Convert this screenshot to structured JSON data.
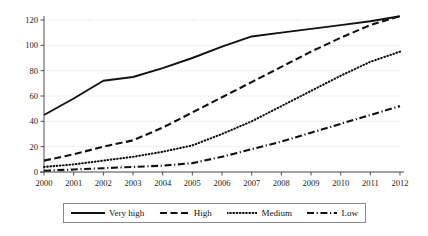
{
  "chart_data": {
    "type": "line",
    "title": "",
    "xlabel": "",
    "ylabel": "",
    "x": [
      2000,
      2001,
      2002,
      2003,
      2004,
      2005,
      2006,
      2007,
      2008,
      2009,
      2010,
      2011,
      2012
    ],
    "xticklabels": [
      "2000",
      "2001",
      "2002",
      "2003",
      "2004",
      "2005",
      "2006",
      "2007",
      "2008",
      "2009",
      "2010",
      "2011",
      "2012"
    ],
    "yticks": [
      0,
      20,
      40,
      60,
      80,
      100,
      120
    ],
    "yticklabels": [
      "0",
      "20",
      "40",
      "60",
      "80",
      "100",
      "120"
    ],
    "ylim": [
      0,
      128
    ],
    "xlim": [
      2000,
      2012
    ],
    "grid": "horizontal-dotted",
    "legend_position": "bottom-outside",
    "series": [
      {
        "name": "Very high",
        "style": "solid",
        "values": [
          45,
          58,
          72,
          75,
          82,
          90,
          99,
          107,
          110,
          113,
          116,
          119,
          123
        ]
      },
      {
        "name": "High",
        "style": "dashed",
        "values": [
          9,
          14,
          20,
          25,
          35,
          47,
          59,
          71,
          83,
          95,
          106,
          116,
          123
        ]
      },
      {
        "name": "Medium",
        "style": "dotted",
        "values": [
          4,
          6,
          9,
          12,
          16,
          21,
          30,
          40,
          52,
          64,
          76,
          87,
          95
        ]
      },
      {
        "name": "Low",
        "style": "dashdot",
        "values": [
          1,
          2,
          3,
          4,
          5,
          7,
          12,
          18,
          24,
          31,
          38,
          45,
          52
        ]
      }
    ]
  },
  "legend": {
    "items": [
      {
        "label": "Very high",
        "style": "solid"
      },
      {
        "label": "High",
        "style": "dashed"
      },
      {
        "label": "Medium",
        "style": "dotted"
      },
      {
        "label": "Low",
        "style": "dashdot"
      }
    ]
  },
  "colors": {
    "line": "#111111",
    "axis": "#4d4d4d",
    "grid": "#cfcfcf",
    "text": "#1a1a1a",
    "legend_border": "#8a8a8a",
    "background": "#ffffff"
  }
}
